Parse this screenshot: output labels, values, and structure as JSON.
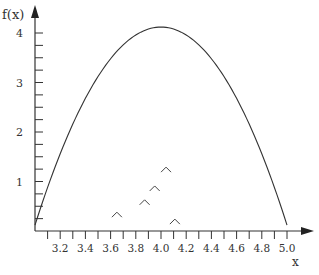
{
  "chart_data": {
    "type": "line",
    "title": "",
    "xlabel": "x",
    "ylabel": "f(x)",
    "xlim": [
      3.0,
      5.0
    ],
    "ylim": [
      0,
      4
    ],
    "x_ticks": [
      "3.2",
      "3.4",
      "3.6",
      "3.8",
      "4.0",
      "4.2",
      "4.4",
      "4.6",
      "4.8",
      "5.0"
    ],
    "y_ticks": [
      "1",
      "2",
      "3",
      "4"
    ],
    "grid": false,
    "legend": null,
    "series": [
      {
        "name": "f(x)",
        "type": "line",
        "description": "Parabola f(x) = 4 - 4(x-4)^2",
        "x": [
          3.0,
          3.2,
          3.4,
          3.6,
          3.8,
          4.0,
          4.2,
          4.4,
          4.6,
          4.8,
          5.0
        ],
        "values": [
          0,
          1.44,
          2.56,
          3.36,
          3.84,
          4.0,
          3.84,
          3.36,
          2.56,
          1.44,
          0
        ]
      },
      {
        "name": "markers",
        "type": "scatter",
        "marker": "caret",
        "points": [
          {
            "x": 3.65,
            "y": 0.38
          },
          {
            "x": 3.87,
            "y": 0.63
          },
          {
            "x": 3.95,
            "y": 0.91
          },
          {
            "x": 4.04,
            "y": 1.29
          },
          {
            "x": 4.11,
            "y": 0.24
          }
        ]
      }
    ]
  }
}
